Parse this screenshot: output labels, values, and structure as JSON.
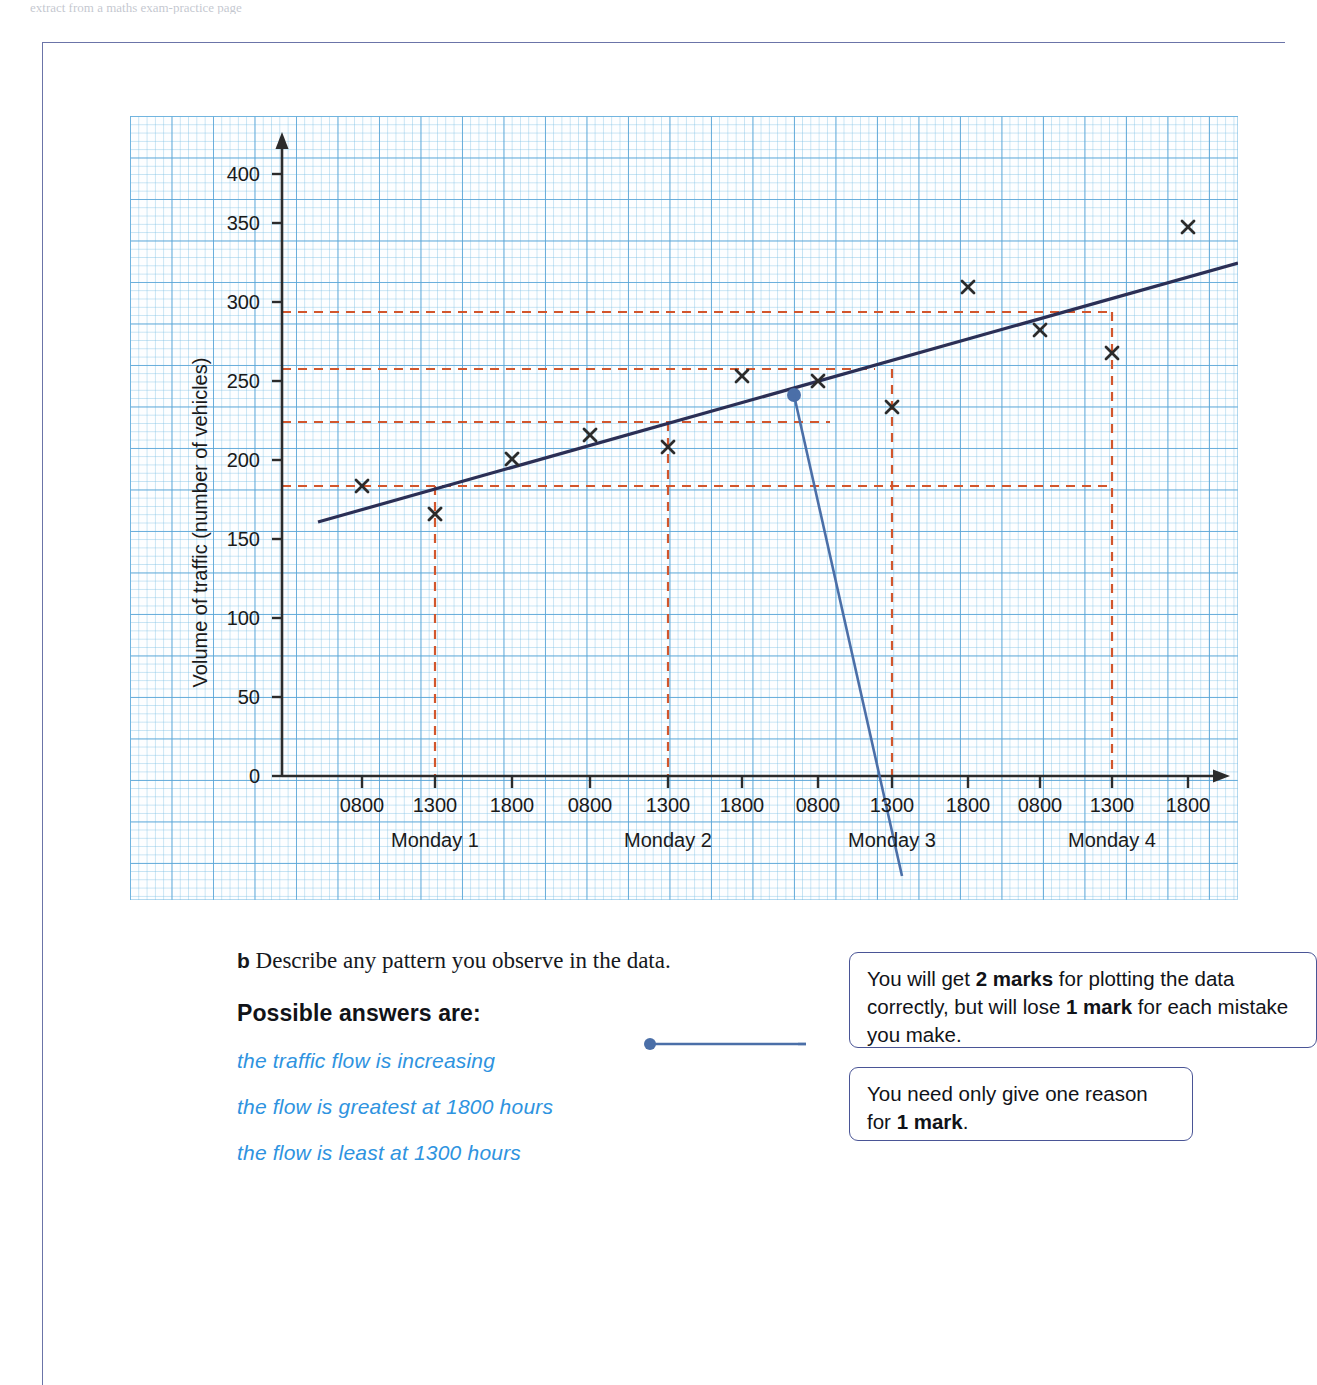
{
  "running_head": "extract from a maths exam-practice page",
  "chart_data": {
    "type": "scatter",
    "title": "",
    "xlabel": "Day",
    "ylabel": "Volume of traffic (number of vehicles)",
    "ylim": [
      0,
      420
    ],
    "yticks": [
      0,
      50,
      100,
      150,
      200,
      250,
      300,
      350,
      400
    ],
    "xticks": [
      "0800",
      "1300",
      "1800",
      "0800",
      "1300",
      "1800",
      "0800",
      "1300",
      "1800",
      "0800",
      "1300",
      "1800"
    ],
    "group_labels": [
      "Monday 1",
      "Monday 2",
      "Monday 3",
      "Monday 4"
    ],
    "grid": true,
    "legend": "none",
    "series": [
      {
        "name": "Volume of traffic",
        "marker": "x",
        "points": [
          {
            "x": "Monday 1 0800",
            "y": 200
          },
          {
            "x": "Monday 1 1300",
            "y": 182
          },
          {
            "x": "Monday 1 1800",
            "y": 216
          },
          {
            "x": "Monday 2 0800",
            "y": 231
          },
          {
            "x": "Monday 2 1300",
            "y": 224
          },
          {
            "x": "Monday 2 1800",
            "y": 268
          },
          {
            "x": "Monday 3 0800",
            "y": 265
          },
          {
            "x": "Monday 3 1300",
            "y": 249
          },
          {
            "x": "Monday 3 1800",
            "y": 325
          },
          {
            "x": "Monday 4 0800",
            "y": 298
          },
          {
            "x": "Monday 4 1300",
            "y": 284
          },
          {
            "x": "Monday 4 1800",
            "y": 374
          }
        ]
      }
    ],
    "trend_line": {
      "name": "trend line",
      "from": {
        "x": "before Monday 1 0800",
        "y": 178
      },
      "to": {
        "x": "after Monday 4 1800",
        "y": 343
      }
    },
    "reference_lines": [
      {
        "value": 200,
        "style": "dashed",
        "color": "#d2562c"
      },
      {
        "value": 238,
        "style": "dashed",
        "color": "#d2562c"
      },
      {
        "value": 278,
        "style": "dashed",
        "color": "#d2562c"
      },
      {
        "value": 318,
        "style": "dashed",
        "color": "#d2562c"
      }
    ],
    "vertical_reference_lines": [
      "Monday 1 1300",
      "Monday 2 1300",
      "Monday 3 1300",
      "Monday 4 1300"
    ]
  },
  "question": {
    "label": "b",
    "text": "Describe any pattern you observe in the data."
  },
  "answers": {
    "heading": "Possible answers are:",
    "items": [
      "the traffic flow is increasing",
      "the flow is greatest at 1800 hours",
      "the flow is least at 1300 hours"
    ]
  },
  "callouts": [
    {
      "id": "marks",
      "parts": [
        {
          "text": "You will get ",
          "bold": false
        },
        {
          "text": "2 marks",
          "bold": true
        },
        {
          "text": " for plotting the data correctly, but will lose ",
          "bold": false
        },
        {
          "text": "1 mark",
          "bold": true
        },
        {
          "text": " for each mistake you make.",
          "bold": false
        }
      ]
    },
    {
      "id": "reason",
      "parts": [
        {
          "text": "You need only give one reason for ",
          "bold": false
        },
        {
          "text": "1 mark",
          "bold": true
        },
        {
          "text": ".",
          "bold": false
        }
      ]
    }
  ],
  "colors": {
    "grid_major": "#5aa5d7",
    "grid_minor": "#82c3e6",
    "axis": "#2b2b2b",
    "data_marker": "#2b2b2b",
    "trend_line": "#2b2f55",
    "reference_line": "#d2562c",
    "callout_border": "#4a5596",
    "answer_text": "#2e93e0",
    "page_border": "#6b74a8"
  }
}
